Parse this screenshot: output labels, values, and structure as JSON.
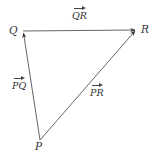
{
  "diagram": {
    "type": "vector-triangle",
    "stroke_color": "#555555",
    "vertices": {
      "Q": {
        "label": "Q",
        "x": 23,
        "y": 31
      },
      "R": {
        "label": "R",
        "x": 136,
        "y": 30
      },
      "P": {
        "label": "P",
        "x": 40,
        "y": 140
      }
    },
    "vectors": [
      {
        "name": "QR",
        "label": "QR",
        "from": "Q",
        "to": "R"
      },
      {
        "name": "PQ",
        "label": "PQ",
        "from": "P",
        "to": "Q"
      },
      {
        "name": "PR",
        "label": "PR",
        "from": "P",
        "to": "R"
      }
    ]
  }
}
